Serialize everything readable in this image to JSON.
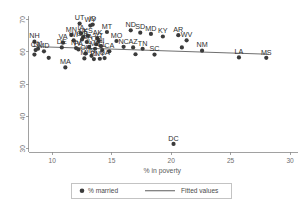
{
  "chart_data": {
    "type": "scatter",
    "title": "",
    "xlabel": "% in poverty",
    "ylabel": "",
    "xlim": [
      8,
      30.5
    ],
    "ylim": [
      29,
      71
    ],
    "xticks": [
      10,
      15,
      20,
      25,
      30
    ],
    "yticks": [
      30,
      40,
      50,
      60,
      70
    ],
    "grid": false,
    "legend_position": "bottom",
    "series": [
      {
        "name": "% married",
        "marker": "filled-circle",
        "color": "#3b3b3b",
        "points": [
          {
            "label": "NH",
            "x": 8.5,
            "y": 63.2
          },
          {
            "label": "CT",
            "x": 8.6,
            "y": 60.6
          },
          {
            "label": "",
            "x": 8.5,
            "y": 59.2
          },
          {
            "label": "NJ",
            "x": 8.8,
            "y": 61.0
          },
          {
            "label": "MD",
            "x": 9.3,
            "y": 60.2
          },
          {
            "label": "",
            "x": 9.7,
            "y": 58.2
          },
          {
            "label": "MA",
            "x": 11.1,
            "y": 55.2
          },
          {
            "label": "DE",
            "x": 10.8,
            "y": 61.4
          },
          {
            "label": "VA",
            "x": 10.9,
            "y": 62.9
          },
          {
            "label": "MN",
            "x": 11.6,
            "y": 65.3
          },
          {
            "label": "NV",
            "x": 12.0,
            "y": 61.2
          },
          {
            "label": "WI",
            "x": 11.8,
            "y": 63.6
          },
          {
            "label": "UT",
            "x": 12.3,
            "y": 68.8
          },
          {
            "label": "IA",
            "x": 12.4,
            "y": 65.8
          },
          {
            "label": "CO",
            "x": 12.5,
            "y": 63.9
          },
          {
            "label": "NE",
            "x": 12.6,
            "y": 64.6
          },
          {
            "label": "WY",
            "x": 13.2,
            "y": 68.2
          },
          {
            "label": "ID",
            "x": 13.4,
            "y": 68.5
          },
          {
            "label": "KS",
            "x": 13.0,
            "y": 65.0
          },
          {
            "label": "PA",
            "x": 12.2,
            "y": 60.8
          },
          {
            "label": "IL",
            "x": 13.1,
            "y": 61.6
          },
          {
            "label": "OH",
            "x": 12.8,
            "y": 59.5
          },
          {
            "label": "IN",
            "x": 13.3,
            "y": 58.8
          },
          {
            "label": "MI",
            "x": 12.7,
            "y": 58.0
          },
          {
            "label": "RI",
            "x": 13.5,
            "y": 57.8
          },
          {
            "label": "OR",
            "x": 13.7,
            "y": 62.4
          },
          {
            "label": "WA",
            "x": 12.9,
            "y": 63.1
          },
          {
            "label": "ME",
            "x": 13.6,
            "y": 61.0
          },
          {
            "label": "VT",
            "x": 13.9,
            "y": 63.4
          },
          {
            "label": "NY",
            "x": 14.0,
            "y": 57.9
          },
          {
            "label": "GA",
            "x": 14.4,
            "y": 58.1
          },
          {
            "label": "MT",
            "x": 14.6,
            "y": 66.2
          },
          {
            "label": "AK",
            "x": 13.8,
            "y": 64.2
          },
          {
            "label": "FL",
            "x": 14.2,
            "y": 60.6
          },
          {
            "label": "CA",
            "x": 14.8,
            "y": 60.2
          },
          {
            "label": "HI",
            "x": 14.1,
            "y": 61.8
          },
          {
            "label": "MO",
            "x": 15.4,
            "y": 63.4
          },
          {
            "label": "ND",
            "x": 16.6,
            "y": 66.7
          },
          {
            "label": "SD",
            "x": 17.4,
            "y": 66.0
          },
          {
            "label": "NC",
            "x": 16.0,
            "y": 61.6
          },
          {
            "label": "AZ",
            "x": 16.8,
            "y": 61.4
          },
          {
            "label": "TN",
            "x": 17.6,
            "y": 61.0
          },
          {
            "label": "",
            "x": 17.0,
            "y": 59.3
          },
          {
            "label": "MD2",
            "x": 18.3,
            "y": 65.6
          },
          {
            "label": "SC",
            "x": 18.6,
            "y": 59.2
          },
          {
            "label": "KY",
            "x": 19.3,
            "y": 64.8
          },
          {
            "label": "AR",
            "x": 20.6,
            "y": 65.2
          },
          {
            "label": "WV",
            "x": 21.3,
            "y": 63.6
          },
          {
            "label": "",
            "x": 20.9,
            "y": 61.4
          },
          {
            "label": "DC",
            "x": 20.2,
            "y": 31.5
          },
          {
            "label": "NM",
            "x": 22.6,
            "y": 60.4
          },
          {
            "label": "LA",
            "x": 25.7,
            "y": 58.3
          },
          {
            "label": "MS",
            "x": 28.0,
            "y": 58.2
          }
        ]
      },
      {
        "name": "Fitted values",
        "marker": "line",
        "color": "#4a4a4a",
        "line_endpoints": [
          {
            "x": 8.4,
            "y": 61.7
          },
          {
            "x": 28.2,
            "y": 59.3
          }
        ]
      }
    ]
  },
  "legend": {
    "entries": [
      {
        "label": "% married",
        "marker": "dot"
      },
      {
        "label": "Fitted values",
        "marker": "line"
      }
    ]
  },
  "axes": {
    "x": {
      "title": "% in poverty",
      "tick_labels": [
        "10",
        "15",
        "20",
        "25",
        "30"
      ]
    },
    "y": {
      "title": "",
      "tick_labels": [
        "30",
        "40",
        "50",
        "60",
        "70"
      ]
    }
  }
}
